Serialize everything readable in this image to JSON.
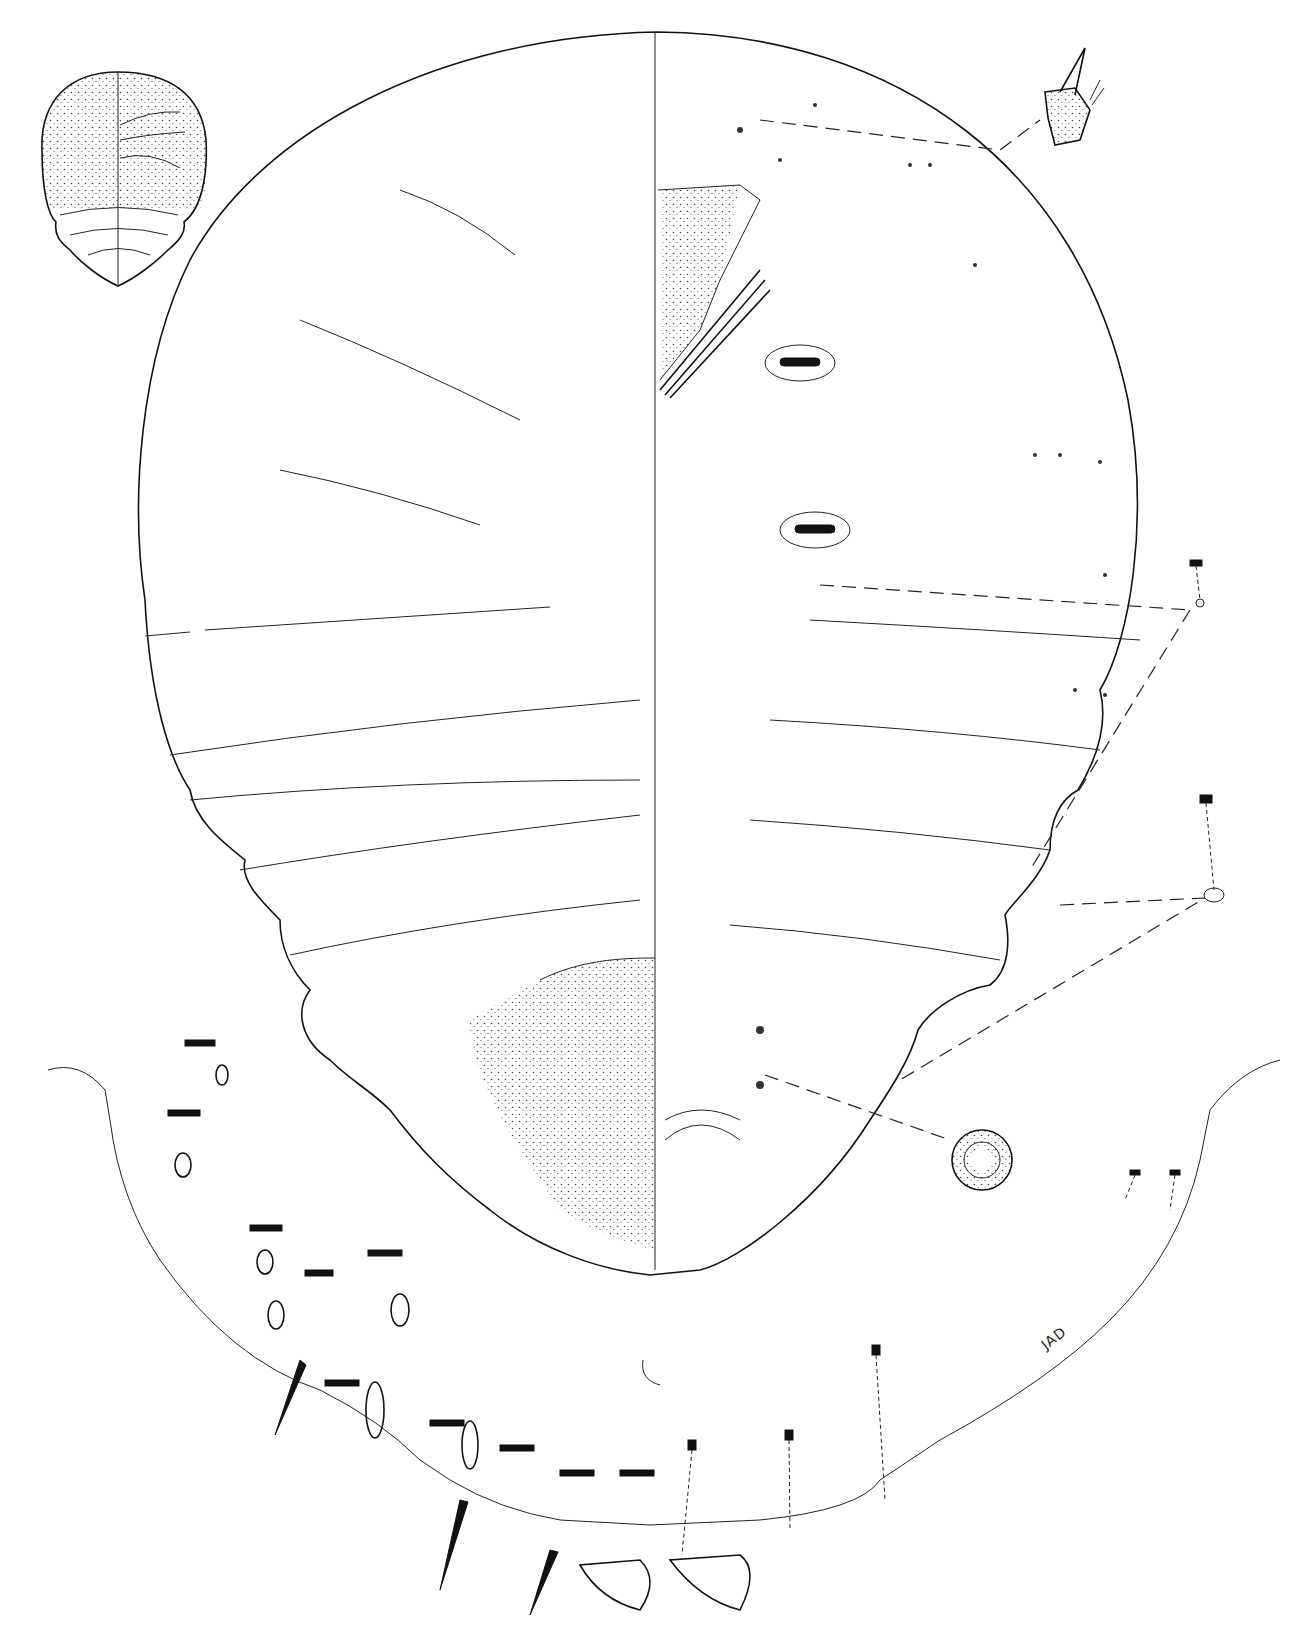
{
  "figure": {
    "signature": "JAD",
    "colors": {
      "ink": "#111111",
      "background": "#ffffff"
    },
    "components": [
      {
        "name": "habitus-inset",
        "position": "top-left"
      },
      {
        "name": "main-body-outline",
        "position": "center"
      },
      {
        "name": "antenna-detail",
        "position": "top-right"
      },
      {
        "name": "spiracle-detail",
        "position": "right"
      },
      {
        "name": "pore-detail",
        "position": "lower-right"
      },
      {
        "name": "pygidium-enlargement",
        "position": "bottom"
      }
    ]
  }
}
